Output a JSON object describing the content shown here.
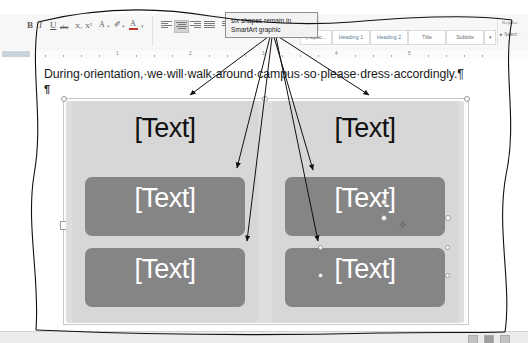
{
  "callout": {
    "line1": "six shapes remain in",
    "line2": "SmartArt graphic",
    "full_text": "six shapes remain in SmartArt graphic",
    "arrow_count": 6
  },
  "ribbon": {
    "groups": [
      {
        "label": "Font",
        "launcher": "⬌"
      },
      {
        "label": "Paragraph",
        "launcher": "⬌"
      },
      {
        "label": "Styles",
        "launcher": "⬌"
      },
      {
        "label": "Editing",
        "launcher": ""
      }
    ],
    "font_group": {
      "bold": "B",
      "italic": "I",
      "underline": "U",
      "strikethrough": "abc",
      "subscript": "X₂",
      "superscript": "X²",
      "text_effects": "A",
      "text_highlight": "✐",
      "font_color": "A"
    },
    "paragraph_group": {
      "align_left": "align-left",
      "align_center": "align-center",
      "align_right": "align-right",
      "justify": "justify",
      "line_spacing": "line-spacing",
      "shading": "shading"
    },
    "styles_gallery": [
      {
        "label": "¶ Spac...",
        "type": "normal"
      },
      {
        "label": "Heading 1",
        "type": "heading"
      },
      {
        "label": "Heading 2",
        "type": "heading"
      },
      {
        "label": "Title",
        "type": "normal"
      },
      {
        "label": "Subtitle",
        "type": "normal"
      },
      {
        "label": "▾",
        "type": "more"
      }
    ],
    "editing_group": {
      "replace": "Replace",
      "select": "Select ·"
    }
  },
  "ruler": {
    "numbers": [
      "1",
      "2",
      "3",
      "4",
      "5"
    ]
  },
  "document": {
    "paragraph_text": "During·orientation,·we·will·walk·around·campus·so·please·dress·accordingly.¶",
    "empty_paragraph_mark": "¶"
  },
  "smartart": {
    "selected": true,
    "columns": [
      {
        "name": "left-column",
        "header": "[Text]",
        "boxes": [
          {
            "label": "[Text]"
          },
          {
            "label": "[Text]"
          }
        ]
      },
      {
        "name": "right-column",
        "header": "[Text]",
        "boxes": [
          {
            "label": "[Text]"
          },
          {
            "label": "[Text]"
          }
        ]
      }
    ],
    "shape_count": 6,
    "colors": {
      "canvas": "#dedede",
      "column": "#d7d7d7",
      "box_fill": "#858585",
      "box_text": "#ffffff",
      "header_text": "#111111"
    }
  },
  "status_bar": {
    "view_buttons": [
      "print-layout",
      "web-layout",
      "read-mode"
    ]
  },
  "cursor": {
    "glyph": "✥"
  }
}
